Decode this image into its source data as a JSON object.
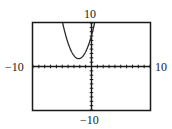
{
  "chart_data": {
    "type": "line",
    "title": "",
    "xlabel": "",
    "ylabel": "",
    "xlim": [
      -10,
      10
    ],
    "ylim": [
      -10,
      10
    ],
    "grid": false,
    "axis_ticks": {
      "x_step": 1,
      "y_step": 1
    },
    "window_labels": {
      "xmin": "−10",
      "xmax": "10",
      "ymin": "−10",
      "ymax": "10"
    },
    "series": [
      {
        "name": "parabola",
        "equation": "y = 1.1(x + 2.2)^2 + 1.8 (approx.)",
        "vertex": [
          -2.2,
          1.8
        ],
        "x": [
          -4.93,
          -4.5,
          -4,
          -3.5,
          -3,
          -2.5,
          -2.2,
          -2,
          -1.5,
          -1,
          -0.5,
          0,
          0.53
        ],
        "y": [
          10.0,
          7.62,
          5.36,
          3.66,
          2.5,
          1.9,
          1.8,
          1.84,
          2.34,
          3.38,
          4.99,
          7.12,
          10.0
        ]
      }
    ],
    "colors": {
      "curve": "#2a2a2a",
      "axes": "#1a1a1a",
      "frame": "#1a1a1a"
    }
  },
  "labels": {
    "ymax": "10",
    "ymin": "−10",
    "xmin": "−10",
    "xmax": "10"
  }
}
